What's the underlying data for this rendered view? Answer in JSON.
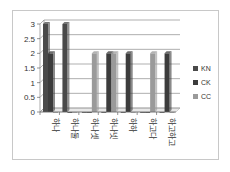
{
  "chart_data": {
    "type": "bar",
    "title": "",
    "xlabel": "",
    "ylabel": "",
    "ylim": [
      0,
      3
    ],
    "yticks": [
      "0",
      "0.5",
      "1",
      "1.5",
      "2",
      "2.5",
      "3"
    ],
    "grid": true,
    "legend_position": "right",
    "categories": [
      "하나",
      "하나둘",
      "하나셋",
      "하나넷",
      "하하",
      "하고다",
      "하고하고"
    ],
    "series": [
      {
        "name": "KN",
        "color": "#4a4a4a",
        "values": [
          3,
          3,
          0,
          0,
          0,
          0,
          0
        ]
      },
      {
        "name": "CK",
        "color": "#3c3c3c",
        "values": [
          2,
          0,
          0,
          2,
          2,
          0,
          2
        ]
      },
      {
        "name": "CC",
        "color": "#9a9a9a",
        "values": [
          0,
          0,
          2,
          2,
          0,
          2,
          0
        ]
      }
    ]
  }
}
